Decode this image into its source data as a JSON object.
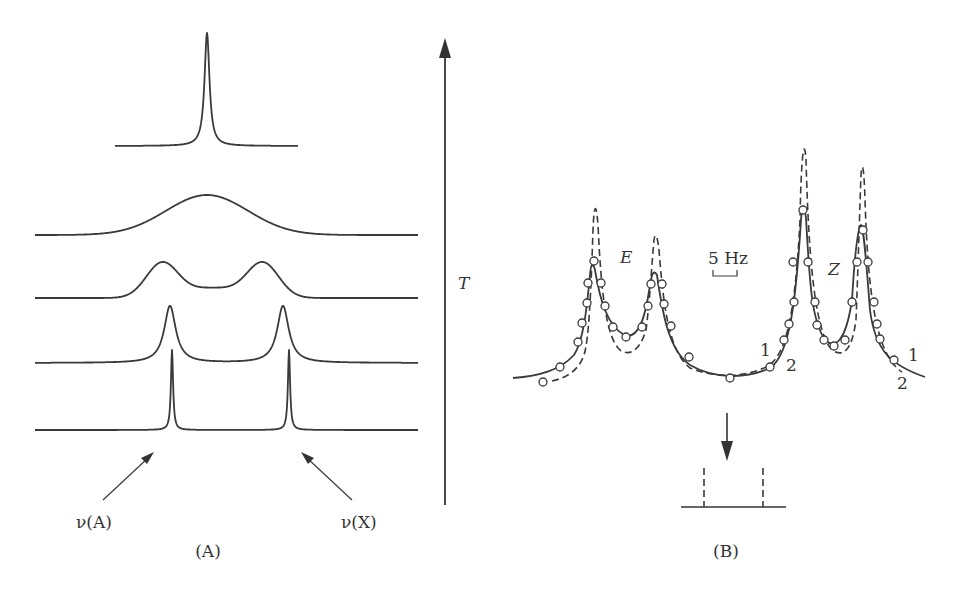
{
  "figure": {
    "panel_a": {
      "caption": "(A)",
      "label_left": "ν(A)",
      "label_right": "ν(X)",
      "axis_label": "T",
      "traces": [
        {
          "name": "coalesced-sharp",
          "baseline_y": 146,
          "x_start": 115,
          "x_end": 298,
          "peaks": [
            {
              "x": 207,
              "top_y": 33,
              "width": 3
            }
          ]
        },
        {
          "name": "broad-coalescence",
          "baseline_y": 235,
          "x_start": 35,
          "x_end": 418,
          "peaks": [
            {
              "x": 207,
              "top_y": 195,
              "width": 55
            }
          ]
        },
        {
          "name": "broadened-doublet",
          "baseline_y": 298,
          "x_start": 35,
          "x_end": 418,
          "peaks": [
            {
              "x": 162,
              "top_y": 258,
              "width": 20
            },
            {
              "x": 263,
              "top_y": 258,
              "width": 20
            }
          ]
        },
        {
          "name": "exchange-broadened",
          "baseline_y": 363,
          "x_start": 35,
          "x_end": 418,
          "peaks": [
            {
              "x": 170,
              "top_y": 306,
              "width": 7
            },
            {
              "x": 283,
              "top_y": 306,
              "width": 7
            }
          ]
        },
        {
          "name": "slow-exchange",
          "baseline_y": 430,
          "x_start": 35,
          "x_end": 418,
          "peaks": [
            {
              "x": 172,
              "top_y": 350,
              "width": 1.3
            },
            {
              "x": 289,
              "top_y": 350,
              "width": 1.3
            }
          ]
        }
      ]
    },
    "panel_b": {
      "caption": "(B)",
      "label_e": "E",
      "label_z": "Z",
      "scale_bar": "5 Hz",
      "curve_labels": [
        "1",
        "2",
        "1",
        "2"
      ],
      "legend": {
        "solid": "1",
        "dashed": "2"
      }
    }
  }
}
